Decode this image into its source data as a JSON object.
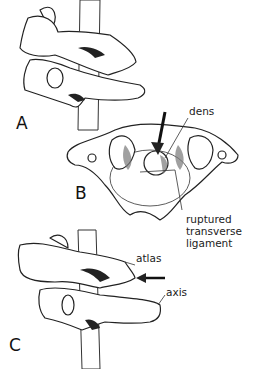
{
  "figure": {
    "panels": [
      {
        "id": "A",
        "label": "A"
      },
      {
        "id": "B",
        "label": "B"
      },
      {
        "id": "C",
        "label": "C"
      }
    ],
    "annotations": {
      "dens": "dens",
      "ruptured_line1": "ruptured",
      "ruptured_line2": "transverse",
      "ruptured_line3": "ligament",
      "atlas": "atlas",
      "axis": "axis"
    },
    "colors": {
      "line": "#222222",
      "background": "#ffffff"
    }
  }
}
